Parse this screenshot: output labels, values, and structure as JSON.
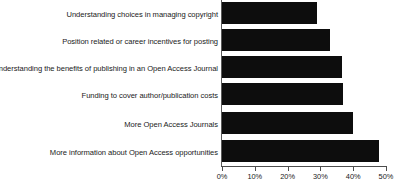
{
  "chart_data": {
    "type": "bar",
    "orientation": "horizontal",
    "title": "",
    "xlabel": "",
    "ylabel": "",
    "xlim": [
      0,
      50
    ],
    "grid": false,
    "legend": false,
    "bar_color": "#0d0d0d",
    "categories": [
      "Understanding choices in managing copyright",
      "Position related or career incentives for posting",
      "Understanding the benefits of publishing in an Open Access Journal",
      "Funding to cover author/publication costs",
      "More Open Access Journals",
      "More information about Open Access opportunities"
    ],
    "values": [
      29,
      33,
      36.5,
      37,
      40,
      48
    ],
    "xticks": [
      0,
      10,
      20,
      30,
      40,
      50
    ],
    "xtick_labels": [
      "0%",
      "10%",
      "20%",
      "30%",
      "40%",
      "50%"
    ]
  }
}
